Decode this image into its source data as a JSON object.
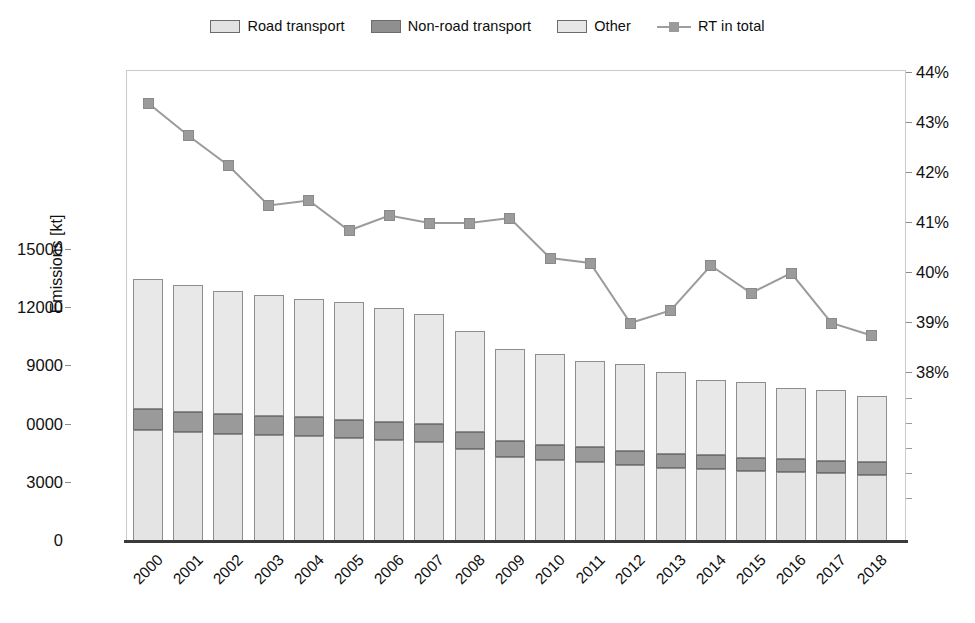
{
  "legend": {
    "items": [
      {
        "label": "Road transport",
        "kind": "swatch",
        "icon": "legend-swatch-road",
        "color": "#e2e2e2"
      },
      {
        "label": "Non-road transport",
        "kind": "swatch",
        "icon": "legend-swatch-nonroad",
        "color": "#8f8f8f"
      },
      {
        "label": "Other",
        "kind": "swatch",
        "icon": "legend-swatch-other",
        "color": "#e7e7e7"
      },
      {
        "label": "RT in total",
        "kind": "line",
        "icon": "legend-line-marker",
        "color": "#9a9a9a"
      }
    ]
  },
  "axes": {
    "y_left_title": "Emissions [kt]",
    "y_left_ticks": [
      "15000",
      "12000",
      "9000",
      "0000",
      "3000",
      "0"
    ],
    "y_right_ticks": [
      "44%",
      "43%",
      "42%",
      "41%",
      "40%",
      "39%",
      "38%"
    ]
  },
  "chart_data": {
    "type": "bar",
    "title": "",
    "xlabel": "",
    "ylabel": "Emissions [kt]",
    "y2label": "",
    "ylim": [
      0,
      15750
    ],
    "y2lim": [
      37.58,
      44.0
    ],
    "grid": false,
    "legend_position": "top-center",
    "categories": [
      "2000",
      "2001",
      "2002",
      "2003",
      "2004",
      "2005",
      "2006",
      "2007",
      "2008",
      "2009",
      "2010",
      "2011",
      "2012",
      "2013",
      "2014",
      "2015",
      "2016",
      "2017",
      "2018"
    ],
    "series": [
      {
        "name": "Road transport",
        "type": "bar-stacked",
        "color": "#e4e4e4",
        "values": [
          5700,
          5620,
          5520,
          5450,
          5400,
          5300,
          5180,
          5120,
          4750,
          4350,
          4150,
          4080,
          3900,
          3760,
          3720,
          3620,
          3560,
          3480,
          3420
        ]
      },
      {
        "name": "Non-road transport",
        "type": "bar-stacked",
        "color": "#9a9a9a",
        "values": [
          1080,
          1050,
          1020,
          1000,
          980,
          960,
          940,
          920,
          860,
          800,
          780,
          760,
          720,
          700,
          690,
          670,
          660,
          640,
          630
        ]
      },
      {
        "name": "Other",
        "type": "bar-stacked",
        "color": "#e8e8e8",
        "values": [
          6720,
          6530,
          6360,
          6250,
          6120,
          6040,
          5880,
          5660,
          5240,
          4750,
          4720,
          4460,
          4480,
          4240,
          3890,
          3910,
          3680,
          3680,
          3450
        ]
      },
      {
        "name": "RT in total",
        "type": "line",
        "axis": "right",
        "color": "#9b9b9b",
        "values": [
          43.4,
          42.75,
          42.15,
          41.35,
          41.45,
          40.85,
          41.15,
          41.0,
          41.0,
          41.1,
          40.3,
          40.2,
          39.0,
          39.25,
          40.15,
          39.6,
          40.0,
          39.0,
          38.75
        ]
      }
    ],
    "totals": [
      13500,
      13200,
      12900,
      12700,
      12500,
      12300,
      12000,
      11700,
      10850,
      9900,
      9650,
      9300,
      9100,
      8700,
      8300,
      8200,
      7900,
      7800,
      7500
    ]
  }
}
